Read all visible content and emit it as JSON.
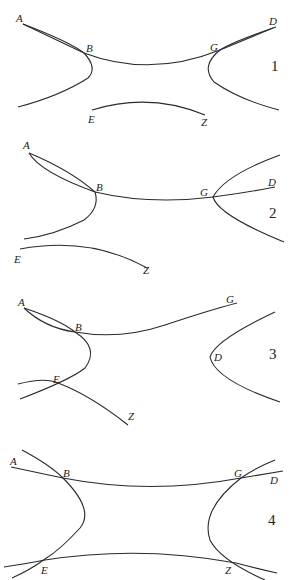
{
  "figure": {
    "panels": [
      {
        "number": "1",
        "labels": {
          "A": "A",
          "B": "B",
          "G": "G",
          "D": "D",
          "E": "E",
          "Z": "Z"
        }
      },
      {
        "number": "2",
        "labels": {
          "A": "A",
          "B": "B",
          "G": "G",
          "D": "D",
          "E": "E",
          "Z": "Z"
        }
      },
      {
        "number": "3",
        "labels": {
          "A": "A",
          "B": "B",
          "G": "G",
          "D": "D",
          "E": "E",
          "Z": "Z"
        }
      },
      {
        "number": "4",
        "labels": {
          "A": "A",
          "B": "B",
          "G": "G",
          "D": "D",
          "E": "E",
          "Z": "Z"
        }
      }
    ]
  }
}
